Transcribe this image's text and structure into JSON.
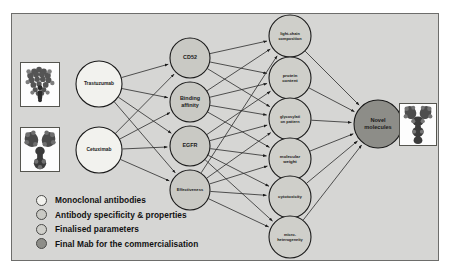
{
  "figure": {
    "background": "#d6d6d4",
    "frame_border": "#6d6d6b",
    "edge_color": "#2b2b2b"
  },
  "colors": {
    "monoclonal": "#f2f2ee",
    "specificity": "#c9c9c4",
    "finalised": "#cfcfca",
    "final_mab": "#8d8d88",
    "node_stroke": "#1b1b1b"
  },
  "nodes": {
    "inputs": [
      {
        "id": "trastuzumab",
        "label": "Trastuzumab",
        "cx": 99,
        "cy": 84,
        "r": 23,
        "group": "monoclonal"
      },
      {
        "id": "cetuximab",
        "label": "Cetuximab",
        "cx": 99,
        "cy": 150,
        "r": 23,
        "group": "monoclonal"
      }
    ],
    "properties": [
      {
        "id": "cd52",
        "label": "CD52",
        "cx": 190,
        "cy": 58,
        "r": 20,
        "group": "specificity"
      },
      {
        "id": "binding-affinity",
        "label": "Binding affinity",
        "line1": "Binding",
        "line2": "affinity",
        "cx": 190,
        "cy": 102,
        "r": 20,
        "group": "specificity"
      },
      {
        "id": "egfr",
        "label": "EGFR",
        "cx": 190,
        "cy": 146,
        "r": 20,
        "group": "specificity"
      },
      {
        "id": "effectiveness",
        "label": "Effectiveness",
        "cx": 190,
        "cy": 190,
        "r": 20,
        "group": "specificity"
      }
    ],
    "parameters": [
      {
        "id": "light-chain-composition",
        "label": "light-chain composition",
        "line1": "light-chain",
        "line2": "composition",
        "cx": 290,
        "cy": 36,
        "r": 21,
        "group": "finalised"
      },
      {
        "id": "protein-content",
        "label": "protein content",
        "line1": "protein",
        "line2": "content",
        "cx": 290,
        "cy": 78,
        "r": 21,
        "group": "finalised"
      },
      {
        "id": "glycosylation-pattern",
        "label": "glycosylation pattern",
        "line1": "glycosylati",
        "line2": "on pattern",
        "cx": 290,
        "cy": 119,
        "r": 21,
        "group": "finalised"
      },
      {
        "id": "molecular-weight",
        "label": "molecular weight",
        "line1": "molecular",
        "line2": "weight",
        "cx": 290,
        "cy": 159,
        "r": 21,
        "group": "finalised"
      },
      {
        "id": "cytotoxicity",
        "label": "cytotoxicity",
        "line1": "cytotoxicity",
        "line2": "",
        "cx": 290,
        "cy": 197,
        "r": 21,
        "group": "finalised"
      },
      {
        "id": "micro-heterogeneity",
        "label": "micro-heterogeneity",
        "line1": "micro-",
        "line2": "heterogeneity",
        "cx": 290,
        "cy": 237,
        "r": 21,
        "group": "finalised"
      }
    ],
    "output": [
      {
        "id": "novel-molecules",
        "label": "Novel molecules",
        "line1": "Novel",
        "line2": "molecules",
        "cx": 378,
        "cy": 124,
        "r": 24,
        "group": "final_mab"
      }
    ]
  },
  "edges": [
    {
      "from": "trastuzumab",
      "to": "cd52"
    },
    {
      "from": "trastuzumab",
      "to": "binding-affinity"
    },
    {
      "from": "trastuzumab",
      "to": "egfr"
    },
    {
      "from": "trastuzumab",
      "to": "effectiveness"
    },
    {
      "from": "cetuximab",
      "to": "cd52"
    },
    {
      "from": "cetuximab",
      "to": "binding-affinity"
    },
    {
      "from": "cetuximab",
      "to": "egfr"
    },
    {
      "from": "cetuximab",
      "to": "effectiveness"
    },
    {
      "from": "cd52",
      "to": "light-chain-composition"
    },
    {
      "from": "cd52",
      "to": "protein-content"
    },
    {
      "from": "cd52",
      "to": "glycosylation-pattern"
    },
    {
      "from": "binding-affinity",
      "to": "light-chain-composition"
    },
    {
      "from": "binding-affinity",
      "to": "protein-content"
    },
    {
      "from": "binding-affinity",
      "to": "glycosylation-pattern"
    },
    {
      "from": "binding-affinity",
      "to": "molecular-weight"
    },
    {
      "from": "egfr",
      "to": "protein-content"
    },
    {
      "from": "egfr",
      "to": "glycosylation-pattern"
    },
    {
      "from": "egfr",
      "to": "molecular-weight"
    },
    {
      "from": "egfr",
      "to": "cytotoxicity"
    },
    {
      "from": "egfr",
      "to": "micro-heterogeneity"
    },
    {
      "from": "effectiveness",
      "to": "light-chain-composition"
    },
    {
      "from": "effectiveness",
      "to": "glycosylation-pattern"
    },
    {
      "from": "effectiveness",
      "to": "molecular-weight"
    },
    {
      "from": "effectiveness",
      "to": "cytotoxicity"
    },
    {
      "from": "effectiveness",
      "to": "micro-heterogeneity"
    },
    {
      "from": "light-chain-composition",
      "to": "novel-molecules"
    },
    {
      "from": "protein-content",
      "to": "novel-molecules"
    },
    {
      "from": "glycosylation-pattern",
      "to": "novel-molecules"
    },
    {
      "from": "molecular-weight",
      "to": "novel-molecules"
    },
    {
      "from": "cytotoxicity",
      "to": "novel-molecules"
    },
    {
      "from": "micro-heterogeneity",
      "to": "novel-molecules"
    }
  ],
  "thumbnails": [
    {
      "id": "trastuzumab-structure",
      "name": "trastuzumab-structure-image",
      "x": 20,
      "y": 62,
      "w": 40,
      "h": 45
    },
    {
      "id": "cetuximab-structure",
      "name": "cetuximab-structure-image",
      "x": 20,
      "y": 127,
      "w": 40,
      "h": 45
    },
    {
      "id": "novel-molecule-structure",
      "name": "novel-molecule-structure-image",
      "x": 399,
      "y": 103,
      "w": 38,
      "h": 43
    }
  ],
  "legend": {
    "items": [
      {
        "label": "Monoclonal antibodies",
        "color": "#f2f2ee"
      },
      {
        "label": "Antibody specificity & properties",
        "color": "#c9c9c4"
      },
      {
        "label": "Finalised parameters",
        "color": "#cfcfca"
      },
      {
        "label": "Final Mab for the commercialisation",
        "color": "#8d8d88"
      }
    ]
  }
}
